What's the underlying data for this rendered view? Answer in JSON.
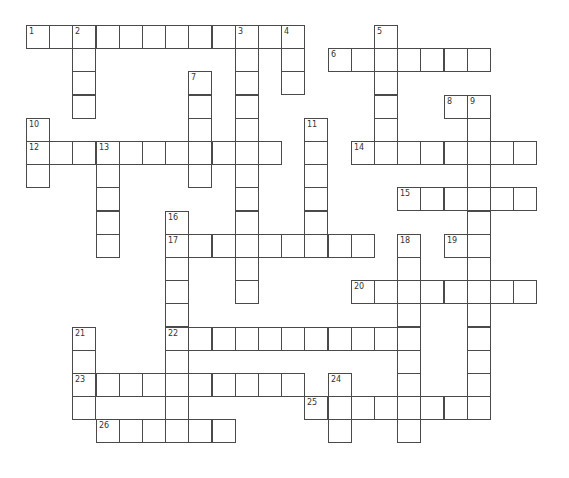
{
  "puzzle": {
    "type": "crossword",
    "grid": {
      "origin_x": 26,
      "origin_y": 25,
      "cell_size": 23.2,
      "border_color": "#4a4a4a",
      "background": "#ffffff"
    },
    "entries": [
      {
        "number": "1",
        "direction": "across",
        "row": 0,
        "col": 0,
        "length": 12
      },
      {
        "number": "2",
        "direction": "down",
        "row": 0,
        "col": 2,
        "length": 4
      },
      {
        "number": "3",
        "direction": "down",
        "row": 0,
        "col": 9,
        "length": 12
      },
      {
        "number": "4",
        "direction": "down",
        "row": 0,
        "col": 11,
        "length": 3
      },
      {
        "number": "5",
        "direction": "down",
        "row": 0,
        "col": 15,
        "length": 6
      },
      {
        "number": "6",
        "direction": "across",
        "row": 1,
        "col": 13,
        "length": 7
      },
      {
        "number": "7",
        "direction": "down",
        "row": 2,
        "col": 7,
        "length": 5
      },
      {
        "number": "8",
        "direction": "across",
        "row": 3,
        "col": 18,
        "length": 2
      },
      {
        "number": "9",
        "direction": "down",
        "row": 3,
        "col": 19,
        "length": 13
      },
      {
        "number": "10",
        "direction": "down",
        "row": 4,
        "col": 0,
        "length": 3
      },
      {
        "number": "11",
        "direction": "down",
        "row": 4,
        "col": 12,
        "length": 6
      },
      {
        "number": "12",
        "direction": "across",
        "row": 5,
        "col": 0,
        "length": 11
      },
      {
        "number": "13",
        "direction": "down",
        "row": 5,
        "col": 3,
        "length": 5
      },
      {
        "number": "14",
        "direction": "across",
        "row": 5,
        "col": 14,
        "length": 8
      },
      {
        "number": "15",
        "direction": "across",
        "row": 7,
        "col": 16,
        "length": 6
      },
      {
        "number": "16",
        "direction": "down",
        "row": 8,
        "col": 6,
        "length": 10
      },
      {
        "number": "17",
        "direction": "across",
        "row": 9,
        "col": 6,
        "length": 9
      },
      {
        "number": "18",
        "direction": "down",
        "row": 9,
        "col": 16,
        "length": 9
      },
      {
        "number": "19",
        "direction": "across",
        "row": 9,
        "col": 18,
        "length": 2
      },
      {
        "number": "20",
        "direction": "across",
        "row": 11,
        "col": 14,
        "length": 8
      },
      {
        "number": "21",
        "direction": "down",
        "row": 13,
        "col": 2,
        "length": 4
      },
      {
        "number": "22",
        "direction": "across",
        "row": 13,
        "col": 6,
        "length": 11
      },
      {
        "number": "23",
        "direction": "across",
        "row": 15,
        "col": 2,
        "length": 10
      },
      {
        "number": "24",
        "direction": "down",
        "row": 15,
        "col": 13,
        "length": 3
      },
      {
        "number": "25",
        "direction": "across",
        "row": 16,
        "col": 12,
        "length": 8
      },
      {
        "number": "26",
        "direction": "across",
        "row": 17,
        "col": 3,
        "length": 6
      }
    ]
  }
}
